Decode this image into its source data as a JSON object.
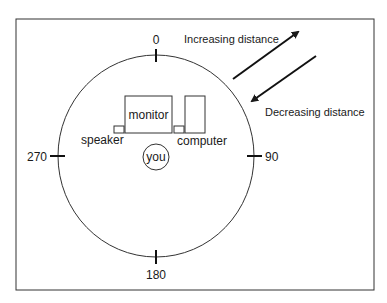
{
  "diagram": {
    "angles": {
      "top": "0",
      "right": "90",
      "bottom": "180",
      "left": "270"
    },
    "objects": {
      "monitor": "monitor",
      "computer": "computer",
      "speaker": "speaker",
      "listener": "you"
    },
    "arrows": {
      "outward": "Increasing distance",
      "inward": "Decreasing distance"
    },
    "colors": {
      "stroke": "#1a1a1a",
      "background": "#ffffff"
    }
  }
}
